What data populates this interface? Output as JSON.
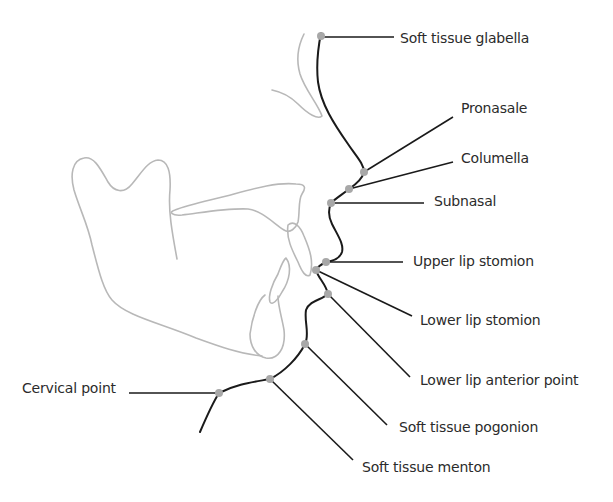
{
  "figure": {
    "type": "cephalometric soft tissue landmarks diagram",
    "colors": {
      "profile_line": "#1a1a1a",
      "bone_outline": "#b8b8b8",
      "landmark_dot": "#a8a8a8",
      "label_text": "#2b2b2b",
      "background": "#ffffff"
    },
    "landmarks": [
      {
        "id": "soft-tissue-glabella",
        "label": "Soft tissue glabella",
        "point": [
          321,
          37
        ],
        "label_pos": [
          400,
          30
        ]
      },
      {
        "id": "pronasale",
        "label": "Pronasale",
        "point": [
          364,
          172
        ],
        "label_pos": [
          461,
          100
        ]
      },
      {
        "id": "columella",
        "label": "Columella",
        "point": [
          349,
          189
        ],
        "label_pos": [
          461,
          150
        ]
      },
      {
        "id": "subnasal",
        "label": "Subnasal",
        "point": [
          331,
          203
        ],
        "label_pos": [
          434,
          193
        ]
      },
      {
        "id": "upper-lip-stomion",
        "label": "Upper lip stomion",
        "point": [
          326,
          262
        ],
        "label_pos": [
          413,
          253
        ]
      },
      {
        "id": "lower-lip-stomion",
        "label": "Lower lip stomion",
        "point": [
          316,
          270
        ],
        "label_pos": [
          420,
          312
        ]
      },
      {
        "id": "lower-lip-anterior-point",
        "label": "Lower lip anterior point",
        "point": [
          328,
          294
        ],
        "label_pos": [
          420,
          372
        ]
      },
      {
        "id": "soft-tissue-pogonion",
        "label": "Soft tissue pogonion",
        "point": [
          305,
          344
        ],
        "label_pos": [
          399,
          419
        ]
      },
      {
        "id": "soft-tissue-menton",
        "label": "Soft tissue menton",
        "point": [
          270,
          379
        ],
        "label_pos": [
          362,
          459
        ]
      },
      {
        "id": "cervical-point",
        "label": "Cervical point",
        "point": [
          219,
          393
        ],
        "label_pos": [
          22,
          380
        ]
      }
    ]
  }
}
